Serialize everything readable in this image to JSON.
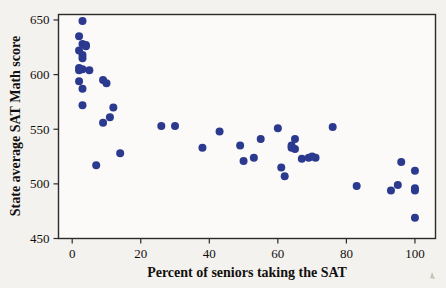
{
  "figure": {
    "background_color": "#f4f2ee",
    "plot_background_color": "#fbfaf8",
    "frame_color": "#2b2b2b",
    "point_color": "#2b3a8f"
  },
  "chart_data": {
    "type": "scatter",
    "title": "",
    "xlabel": "Percent of seniors taking the SAT",
    "ylabel": "State average SAT Math score",
    "xlim": [
      -4,
      106
    ],
    "ylim": [
      450,
      655
    ],
    "grid": false,
    "legend": null,
    "xticks": [
      0,
      20,
      40,
      60,
      80,
      100
    ],
    "xtick_labels": [
      "0",
      "20",
      "40",
      "60",
      "80",
      "100"
    ],
    "yticks": [
      450,
      500,
      550,
      600,
      650
    ],
    "ytick_labels": [
      "450",
      "500",
      "550",
      "600",
      "650"
    ],
    "marker": "circle",
    "marker_size": 4,
    "points": [
      {
        "x": 3,
        "y": 649
      },
      {
        "x": 2,
        "y": 635
      },
      {
        "x": 3,
        "y": 628
      },
      {
        "x": 2,
        "y": 622
      },
      {
        "x": 4,
        "y": 627
      },
      {
        "x": 4,
        "y": 626
      },
      {
        "x": 3,
        "y": 618
      },
      {
        "x": 3,
        "y": 615
      },
      {
        "x": 2,
        "y": 606
      },
      {
        "x": 3,
        "y": 605
      },
      {
        "x": 2,
        "y": 604
      },
      {
        "x": 5,
        "y": 604
      },
      {
        "x": 2,
        "y": 594
      },
      {
        "x": 3,
        "y": 587
      },
      {
        "x": 3,
        "y": 572
      },
      {
        "x": 9,
        "y": 595
      },
      {
        "x": 10,
        "y": 592
      },
      {
        "x": 12,
        "y": 570
      },
      {
        "x": 11,
        "y": 561
      },
      {
        "x": 9,
        "y": 556
      },
      {
        "x": 14,
        "y": 528
      },
      {
        "x": 7,
        "y": 517
      },
      {
        "x": 26,
        "y": 553
      },
      {
        "x": 30,
        "y": 553
      },
      {
        "x": 38,
        "y": 533
      },
      {
        "x": 43,
        "y": 548
      },
      {
        "x": 49,
        "y": 535
      },
      {
        "x": 50,
        "y": 521
      },
      {
        "x": 53,
        "y": 524
      },
      {
        "x": 55,
        "y": 541
      },
      {
        "x": 60,
        "y": 551
      },
      {
        "x": 61,
        "y": 515
      },
      {
        "x": 62,
        "y": 507
      },
      {
        "x": 64,
        "y": 533
      },
      {
        "x": 64,
        "y": 535
      },
      {
        "x": 65,
        "y": 541
      },
      {
        "x": 65,
        "y": 532
      },
      {
        "x": 67,
        "y": 523
      },
      {
        "x": 69,
        "y": 524
      },
      {
        "x": 70,
        "y": 525
      },
      {
        "x": 71,
        "y": 524
      },
      {
        "x": 76,
        "y": 552
      },
      {
        "x": 83,
        "y": 498
      },
      {
        "x": 93,
        "y": 494
      },
      {
        "x": 95,
        "y": 499
      },
      {
        "x": 96,
        "y": 520
      },
      {
        "x": 100,
        "y": 512
      },
      {
        "x": 100,
        "y": 496
      },
      {
        "x": 100,
        "y": 494
      },
      {
        "x": 100,
        "y": 469
      }
    ]
  }
}
